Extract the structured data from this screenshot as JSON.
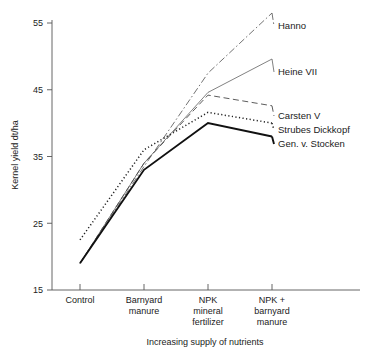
{
  "chart_data": {
    "type": "line",
    "title": "",
    "xlabel": "Increasing supply of nutrients",
    "ylabel": "Kernel yield dt/ha",
    "categories": [
      "Control",
      "Barnyard manure",
      "NPK mineral fertilizer",
      "NPK + barnyard manure"
    ],
    "category_lines": [
      [
        "Control"
      ],
      [
        "Barnyard",
        "manure"
      ],
      [
        "NPK",
        "mineral",
        "fertilizer"
      ],
      [
        "NPK +",
        "barnyard",
        "manure"
      ]
    ],
    "ylim": [
      15,
      57
    ],
    "yticks": [
      15,
      25,
      35,
      45,
      55
    ],
    "ytick_labels": [
      "15",
      "25",
      "35",
      "45",
      "55"
    ],
    "grid": false,
    "legend_position": "right-inline-labels",
    "series": [
      {
        "name": "Hanno",
        "style": "dash-dot-thin",
        "color": "#5a5a5a",
        "values": [
          19.0,
          33.5,
          47.5,
          56.5
        ]
      },
      {
        "name": "Heine VII",
        "style": "solid-thin",
        "color": "#6a6a6a",
        "values": [
          19.0,
          34.0,
          44.6,
          49.6
        ]
      },
      {
        "name": "Carsten V",
        "style": "dashed",
        "color": "#4a4a4a",
        "values": [
          19.0,
          34.0,
          44.2,
          42.6
        ]
      },
      {
        "name": "Strubes Dickkopf",
        "style": "dotted",
        "color": "#222222",
        "values": [
          22.5,
          36.0,
          41.6,
          40.0
        ]
      },
      {
        "name": "Gen. v. Stocken",
        "style": "solid-thick",
        "color": "#111111",
        "values": [
          19.0,
          33.0,
          40.0,
          38.0
        ]
      }
    ]
  }
}
